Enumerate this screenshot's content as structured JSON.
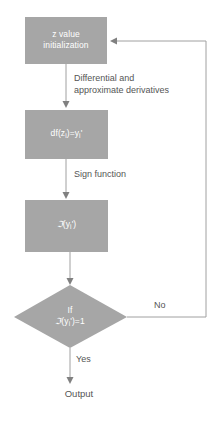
{
  "diagram": {
    "fill_color": "#a6a6a6",
    "line_color": "#a0a0a0",
    "node_text_color": "#ffffff",
    "edge_text_color": "#555555",
    "nodes": [
      {
        "id": "init",
        "shape": "rectangle",
        "label": "z value\ninitialization"
      },
      {
        "id": "derivative",
        "shape": "rectangle",
        "label_prefix": "df(z",
        "label_sub1": "i",
        "label_mid": ")=y",
        "label_sub2": "i",
        "label_suffix": "'",
        "label_plain": "df(z_i)=y_i'"
      },
      {
        "id": "sign",
        "shape": "rectangle",
        "label_symbol": "ℑ",
        "label_open": "(y",
        "label_sub": "i",
        "label_close": "')",
        "label_plain": "ℑ(y_i')"
      },
      {
        "id": "decision",
        "shape": "diamond",
        "label_line1": "If",
        "label_symbol": "ℑ",
        "label_open": "(y",
        "label_sub": "i",
        "label_close": "')=1",
        "label_plain": "If ℑ(y_i')=1"
      },
      {
        "id": "output",
        "shape": "text",
        "label": "Output"
      }
    ],
    "edges": [
      {
        "id": "init-to-derivative",
        "label": "Differential and\napproximate derivatives"
      },
      {
        "id": "derivative-to-sign",
        "label": "Sign function"
      },
      {
        "id": "decision-to-output",
        "label": "Yes"
      },
      {
        "id": "decision-to-init",
        "label": "No"
      }
    ]
  }
}
